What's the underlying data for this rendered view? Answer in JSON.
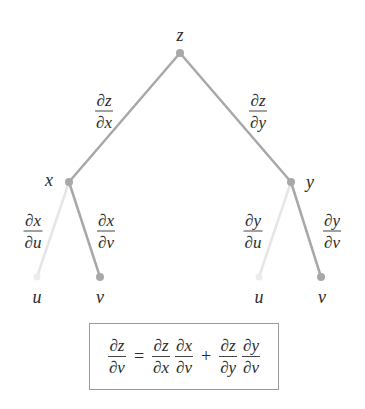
{
  "colors": {
    "branch": "#a8a8a8",
    "faint_branch": "#e4e4e4",
    "node": "#a8a8a8",
    "text": "#2a2a2a",
    "box_border": "#9a9a9a"
  },
  "nodes": {
    "root": {
      "label": "z"
    },
    "mid_left": {
      "label": "x"
    },
    "mid_right": {
      "label": "y"
    },
    "leaf_1": {
      "label": "u"
    },
    "leaf_2": {
      "label": "v"
    },
    "leaf_3": {
      "label": "u"
    },
    "leaf_4": {
      "label": "v"
    }
  },
  "edges": {
    "z_x": {
      "num": "∂z",
      "den": "∂x"
    },
    "z_y": {
      "num": "∂z",
      "den": "∂y"
    },
    "x_u": {
      "num": "∂x",
      "den": "∂u"
    },
    "x_v": {
      "num": "∂x",
      "den": "∂v"
    },
    "y_u": {
      "num": "∂y",
      "den": "∂u"
    },
    "y_v": {
      "num": "∂y",
      "den": "∂v"
    }
  },
  "formula": {
    "lhs": {
      "num": "∂z",
      "den": "∂v"
    },
    "equals": "=",
    "t1a": {
      "num": "∂z",
      "den": "∂x"
    },
    "t1b": {
      "num": "∂x",
      "den": "∂v"
    },
    "plus": "+",
    "t2a": {
      "num": "∂z",
      "den": "∂y"
    },
    "t2b": {
      "num": "∂y",
      "den": "∂v"
    }
  }
}
